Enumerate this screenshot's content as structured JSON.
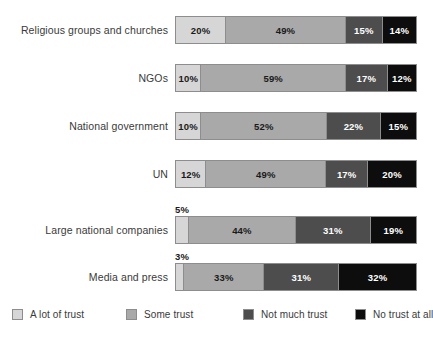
{
  "chart_data": {
    "type": "bar",
    "orientation": "horizontal",
    "stacked": true,
    "normalized": "percent",
    "title": "",
    "subtitle": "",
    "xlabel": "",
    "ylabel": "",
    "xlim": [
      0,
      100
    ],
    "grid": false,
    "legend_position": "bottom",
    "categories": [
      "Religious groups and churches",
      "NGOs",
      "National government",
      "UN",
      "Large national companies",
      "Media and press"
    ],
    "series": [
      {
        "name": "A lot of trust",
        "color": "#d6d6d6",
        "values": [
          20,
          10,
          10,
          12,
          5,
          3
        ]
      },
      {
        "name": "Some trust",
        "color": "#a9a9a9",
        "values": [
          49,
          59,
          52,
          49,
          44,
          33
        ]
      },
      {
        "name": "Not much trust",
        "color": "#4d4d4d",
        "values": [
          15,
          17,
          22,
          17,
          31,
          31
        ]
      },
      {
        "name": "No trust at all",
        "color": "#0d0d0d",
        "values": [
          14,
          12,
          15,
          20,
          19,
          32
        ]
      }
    ],
    "value_labels": [
      [
        "20%",
        "49%",
        "15%",
        "14%"
      ],
      [
        "10%",
        "59%",
        "17%",
        "12%"
      ],
      [
        "10%",
        "52%",
        "22%",
        "15%"
      ],
      [
        "12%",
        "49%",
        "17%",
        "20%"
      ],
      [
        "5%",
        "44%",
        "31%",
        "19%"
      ],
      [
        "3%",
        "33%",
        "31%",
        "32%"
      ]
    ],
    "outside_labels": [
      [
        false,
        false,
        false,
        false
      ],
      [
        false,
        false,
        false,
        false
      ],
      [
        false,
        false,
        false,
        false
      ],
      [
        false,
        false,
        false,
        false
      ],
      [
        true,
        false,
        false,
        false
      ],
      [
        true,
        false,
        false,
        false
      ]
    ],
    "colors": {
      "a_lot_of_trust": "#d6d6d6",
      "some_trust": "#a9a9a9",
      "not_much_trust": "#4d4d4d",
      "no_trust_at_all": "#0d0d0d",
      "bar_outline": "#8d8d8d",
      "label_text": "#3a3a3a",
      "background": "#ffffff"
    }
  },
  "legend": {
    "items": [
      {
        "label": "A lot of trust"
      },
      {
        "label": "Some trust"
      },
      {
        "label": "Not much trust"
      },
      {
        "label": "No trust at all"
      }
    ]
  }
}
